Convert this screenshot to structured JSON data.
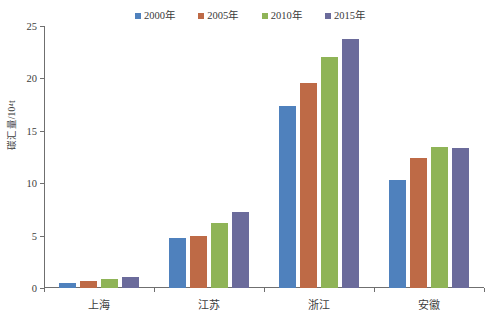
{
  "chart_data": {
    "type": "bar",
    "title": "",
    "xlabel": "",
    "ylabel": "碳汇量/10⁴t",
    "ylim": [
      0,
      25
    ],
    "yticks": [
      0,
      5,
      10,
      15,
      20,
      25
    ],
    "grid": false,
    "legend_position": "top",
    "categories": [
      "上海",
      "江苏",
      "浙江",
      "安徽"
    ],
    "series": [
      {
        "name": "2000年",
        "color": "#4f81bd",
        "values": [
          0.45,
          4.8,
          17.4,
          10.3
        ]
      },
      {
        "name": "2005年",
        "color": "#be6a46",
        "values": [
          0.7,
          5.0,
          19.6,
          12.4
        ]
      },
      {
        "name": "2010年",
        "color": "#8fb457",
        "values": [
          0.85,
          6.2,
          22.0,
          13.5
        ]
      },
      {
        "name": "2015年",
        "color": "#6b6b9b",
        "values": [
          1.05,
          7.3,
          23.8,
          13.4
        ]
      }
    ]
  },
  "axis": {
    "y_tick_labels": [
      "0",
      "5",
      "10",
      "15",
      "20",
      "25"
    ],
    "y_axis_title": "碳汇量/10⁴t"
  },
  "legend": {
    "items": [
      {
        "label": "2000年",
        "color": "#4f81bd"
      },
      {
        "label": "2005年",
        "color": "#be6a46"
      },
      {
        "label": "2010年",
        "color": "#8fb457"
      },
      {
        "label": "2015年",
        "color": "#6b6b9b"
      }
    ]
  },
  "colors": {
    "axis": "#6f6f6f",
    "text": "#3d3d3d",
    "background": "#ffffff"
  }
}
